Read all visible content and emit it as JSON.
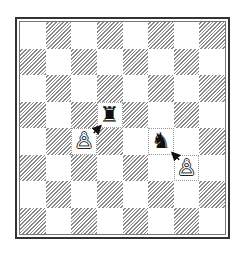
{
  "diagram": {
    "type": "chess-board",
    "orientation": "white-at-bottom",
    "top_left_square": "a8",
    "files": [
      "a",
      "b",
      "c",
      "d",
      "e",
      "f",
      "g",
      "h"
    ],
    "ranks": [
      8,
      7,
      6,
      5,
      4,
      3,
      2,
      1
    ],
    "pieces": [
      {
        "square": "d5",
        "color": "black",
        "type": "rook",
        "glyph": "♜"
      },
      {
        "square": "c4",
        "color": "white",
        "type": "pawn",
        "glyph": "♙"
      },
      {
        "square": "f4",
        "color": "black",
        "type": "knight",
        "glyph": "♞"
      },
      {
        "square": "g3",
        "color": "white",
        "type": "pawn",
        "glyph": "♙"
      }
    ],
    "arrows": [
      {
        "from": "c4",
        "to": "d5",
        "meaning": "pawn attacks rook"
      },
      {
        "from": "g3",
        "to": "f4",
        "meaning": "pawn attacks knight"
      }
    ],
    "colors": {
      "border": "#333333",
      "dark_hatch": "#8a8a8a",
      "light": "#ffffff",
      "piece": "#111111"
    }
  }
}
